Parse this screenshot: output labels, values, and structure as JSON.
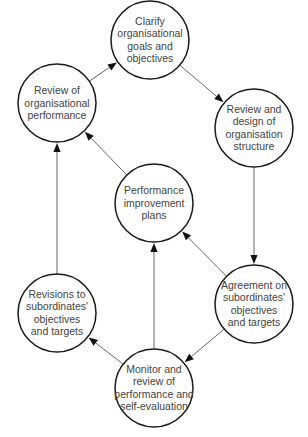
{
  "diagram": {
    "type": "cycle-flow",
    "nodes": [
      {
        "id": "clarify",
        "lines": [
          "Clarify",
          "organisational",
          "goals and",
          "objectives"
        ],
        "cx": 150,
        "cy": 40
      },
      {
        "id": "review-design",
        "lines": [
          "Review and",
          "design of",
          "organisation",
          "structure"
        ],
        "cx": 254,
        "cy": 128
      },
      {
        "id": "agreement",
        "lines": [
          "Agreement on",
          "subordinates'",
          "objectives",
          "and targets"
        ],
        "cx": 254,
        "cy": 304
      },
      {
        "id": "monitor",
        "lines": [
          "Monitor and",
          "review of",
          "performance and",
          "self-evaluation"
        ],
        "cx": 154,
        "cy": 388
      },
      {
        "id": "revisions",
        "lines": [
          "Revisions to",
          "subordinates'",
          "objectives",
          "and targets"
        ],
        "cx": 57,
        "cy": 313
      },
      {
        "id": "review-performance",
        "lines": [
          "Review of",
          "organisational",
          "performance"
        ],
        "cx": 57,
        "cy": 103
      },
      {
        "id": "improvement",
        "lines": [
          "Performance",
          "improvement",
          "plans"
        ],
        "cx": 154,
        "cy": 203
      }
    ],
    "edges": [
      {
        "from": "review-performance",
        "to": "clarify"
      },
      {
        "from": "clarify",
        "to": "review-design"
      },
      {
        "from": "review-design",
        "to": "agreement"
      },
      {
        "from": "agreement",
        "to": "improvement"
      },
      {
        "from": "agreement",
        "to": "monitor"
      },
      {
        "from": "monitor",
        "to": "improvement"
      },
      {
        "from": "monitor",
        "to": "revisions"
      },
      {
        "from": "revisions",
        "to": "review-performance"
      },
      {
        "from": "improvement",
        "to": "review-performance"
      }
    ],
    "node_radius": 39,
    "colors": {
      "stroke": "#1a1a1a",
      "text": "#444444",
      "edge": "#555555",
      "background": "#ffffff"
    }
  }
}
